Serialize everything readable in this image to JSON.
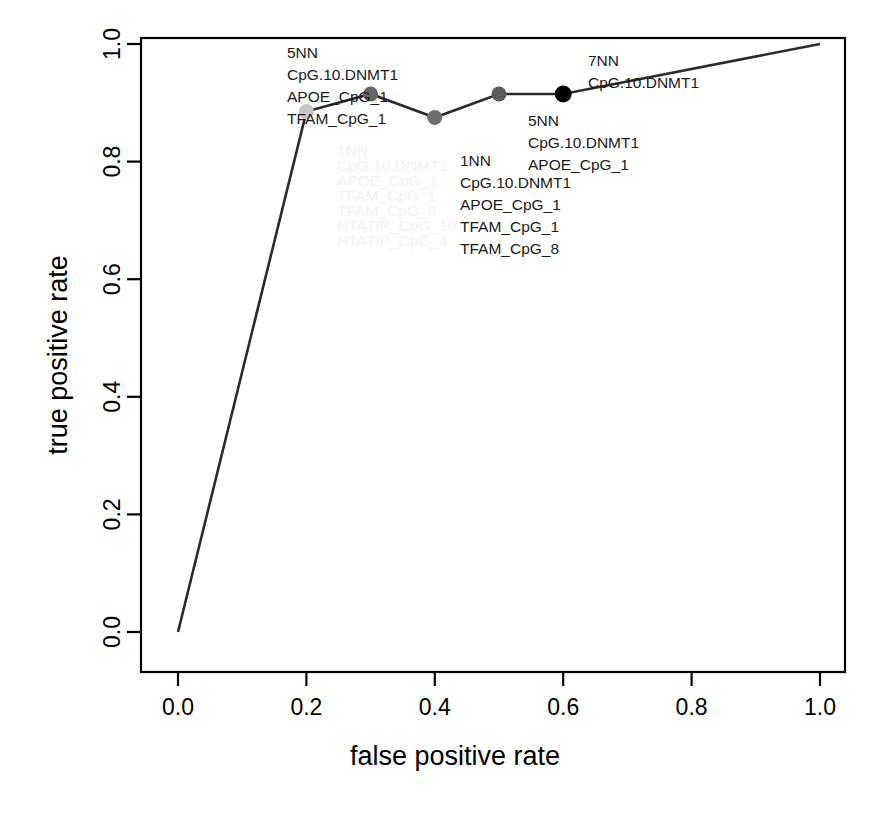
{
  "chart_data": {
    "type": "line",
    "title": "",
    "subtitle": "",
    "xlabel": "false positive rate",
    "ylabel": "true positive rate",
    "xlim": [
      0.0,
      1.0
    ],
    "ylim": [
      0.0,
      1.0
    ],
    "grid": false,
    "legend": "none",
    "x_ticks": [
      "0.0",
      "0.2",
      "0.4",
      "0.6",
      "0.8",
      "1.0"
    ],
    "y_ticks": [
      "0.0",
      "0.2",
      "0.4",
      "0.6",
      "0.8",
      "1.0"
    ],
    "x_tick_values": [
      0.0,
      0.2,
      0.4,
      0.6,
      0.8,
      1.0
    ],
    "y_tick_values": [
      0.0,
      0.2,
      0.4,
      0.6,
      0.8,
      1.0
    ],
    "x": [
      0.0,
      0.2,
      0.3,
      0.4,
      0.5,
      0.6,
      1.0
    ],
    "y": [
      0.0,
      0.885,
      0.915,
      0.875,
      0.915,
      0.915,
      1.0
    ],
    "series": [
      {
        "name": "ROC curve",
        "x": [
          0.0,
          0.2,
          0.3,
          0.4,
          0.5,
          0.6,
          1.0
        ],
        "values": [
          0.0,
          0.885,
          0.915,
          0.875,
          0.915,
          0.915,
          1.0
        ]
      }
    ],
    "markers": [
      {
        "x": 0.2,
        "y": 0.885,
        "color": "#c6c6c6",
        "radius": 7.5
      },
      {
        "x": 0.3,
        "y": 0.915,
        "color": "#666666",
        "radius": 7.5
      },
      {
        "x": 0.4,
        "y": 0.875,
        "color": "#6e6e6e",
        "radius": 7.5
      },
      {
        "x": 0.5,
        "y": 0.915,
        "color": "#5a5a5a",
        "radius": 7.5
      },
      {
        "x": 0.6,
        "y": 0.915,
        "color": "#000000",
        "radius": 8.5
      }
    ],
    "annotations": [
      {
        "id": "ann-top-left",
        "anchor_x": 0.3,
        "anchor_y": 0.915,
        "color": "#1a1a1a",
        "lines": [
          "5NN",
          "CpG.10.DNMT1",
          "APOE_CpG_1",
          "TFAM_CpG_1"
        ]
      },
      {
        "id": "ann-faint",
        "anchor_x": 0.2,
        "anchor_y": 0.885,
        "color": "#f2f2f2",
        "lines": [
          "1NN",
          "CpG.10.DNMT1",
          "APOE_CpG_1",
          "TFAM_CpG_1",
          "TFAM_CpG_8",
          "HTATIP_CpG_10",
          "HTATIP_CpG_4"
        ]
      },
      {
        "id": "ann-middle",
        "anchor_x": 0.4,
        "anchor_y": 0.875,
        "color": "#1a1a1a",
        "lines": [
          "1NN",
          "CpG.10.DNMT1",
          "APOE_CpG_1",
          "TFAM_CpG_1",
          "TFAM_CpG_8"
        ]
      },
      {
        "id": "ann-right",
        "anchor_x": 0.5,
        "anchor_y": 0.915,
        "color": "#1a1a1a",
        "lines": [
          "5NN",
          "CpG.10.DNMT1",
          "APOE_CpG_1"
        ]
      },
      {
        "id": "ann-top-right",
        "anchor_x": 0.6,
        "anchor_y": 0.915,
        "color": "#1a1a1a",
        "lines": [
          "7NN",
          "CpG.10.DNMT1"
        ]
      }
    ]
  },
  "labels": {
    "xlabel": "false positive rate",
    "ylabel": "true positive rate",
    "x_tick_0": "0.0",
    "x_tick_1": "0.2",
    "x_tick_2": "0.4",
    "x_tick_3": "0.6",
    "x_tick_4": "0.8",
    "x_tick_5": "1.0",
    "y_tick_0": "0.0",
    "y_tick_1": "0.2",
    "y_tick_2": "0.4",
    "y_tick_3": "0.6",
    "y_tick_4": "0.8",
    "y_tick_5": "1.0"
  },
  "annotation_text": {
    "a1_l1": "5NN",
    "a1_l2": "CpG.10.DNMT1",
    "a1_l3": "APOE_CpG_1",
    "a1_l4": "TFAM_CpG_1",
    "a2_l1": "1NN",
    "a2_l2": "CpG.10.DNMT1",
    "a2_l3": "APOE_CpG_1",
    "a2_l4": "TFAM_CpG_1",
    "a2_l5": "TFAM_CpG_8",
    "a2_l6": "HTATIP_CpG_10",
    "a2_l7": "HTATIP_CpG_4",
    "a3_l1": "1NN",
    "a3_l2": "CpG.10.DNMT1",
    "a3_l3": "APOE_CpG_1",
    "a3_l4": "TFAM_CpG_1",
    "a3_l5": "TFAM_CpG_8",
    "a4_l1": "5NN",
    "a4_l2": "CpG.10.DNMT1",
    "a4_l3": "APOE_CpG_1",
    "a5_l1": "7NN",
    "a5_l2": "CpG.10.DNMT1"
  },
  "colors": {
    "line": "#2b2b2b",
    "frame": "#000000",
    "marker_light": "#c6c6c6",
    "marker_mid": "#666666",
    "marker_dark": "#000000",
    "faint_text": "#f2f2f2",
    "background": "#ffffff"
  }
}
